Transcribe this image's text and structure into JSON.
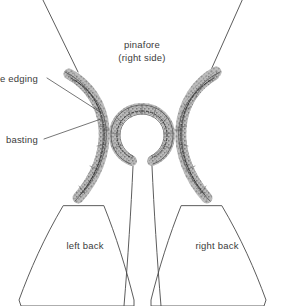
{
  "figure": {
    "title_lines": [
      "pinafore",
      "(right side)"
    ],
    "title_line_1": "pinafore",
    "title_line_2": "(right side)",
    "labels": {
      "lace_edging": "e edging",
      "basting": "basting",
      "left_back": "left back",
      "right_back": "right back"
    },
    "colors": {
      "background": "#ffffff",
      "outline": "#4a4a4a",
      "trim_fill": "#b4b4b4",
      "trim_outline": "#4d4d4d",
      "basting": "#2e2e2e",
      "text": "#3b3b3b"
    }
  }
}
